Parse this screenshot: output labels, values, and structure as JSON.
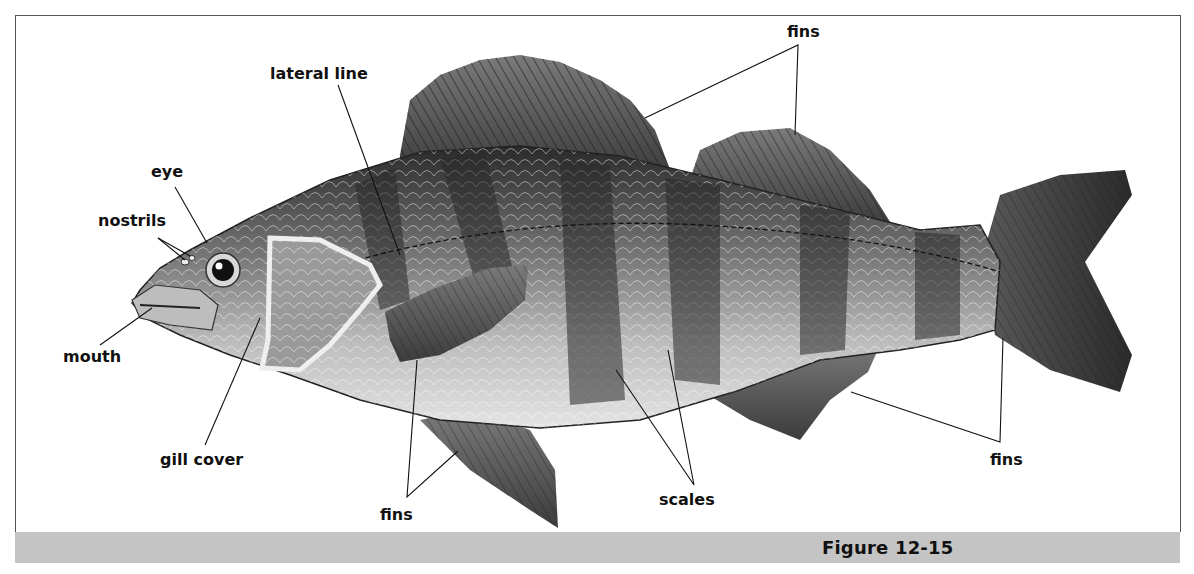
{
  "figure": {
    "caption": "Figure 12-15"
  },
  "labels": {
    "fins_top": "fins",
    "lateral_line": "lateral line",
    "eye": "eye",
    "nostrils": "nostrils",
    "mouth": "mouth",
    "gill_cover": "gill cover",
    "fins_bottom": "fins",
    "scales": "scales",
    "fins_right": "fins"
  },
  "colors": {
    "caption_bar": "#c4c4c4",
    "frame_border": "#555555",
    "label_text": "#111111"
  }
}
